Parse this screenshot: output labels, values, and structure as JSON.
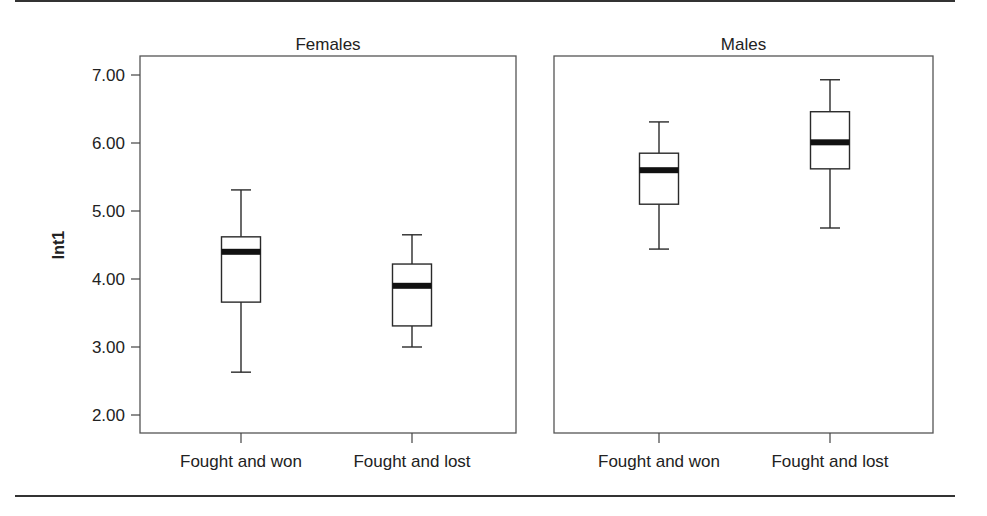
{
  "figure": {
    "y_axis_label": "Int1",
    "panels": [
      "Females",
      "Males"
    ]
  },
  "chart_data": {
    "type": "boxplot",
    "title": "",
    "ylabel": "Int1",
    "xlabel": "",
    "ylim": [
      1.7,
      7.27
    ],
    "yticks": [
      2.0,
      3.0,
      4.0,
      5.0,
      6.0,
      7.0
    ],
    "ytick_labels": [
      "2.00",
      "3.00",
      "4.00",
      "5.00",
      "6.00",
      "7.00"
    ],
    "grid": false,
    "legend": null,
    "panels": [
      {
        "title": "Females",
        "categories": [
          "Fought and won",
          "Fought and lost"
        ],
        "boxes": [
          {
            "label": "Fought and won",
            "whisker_low": 2.63,
            "q1": 3.66,
            "median": 4.4,
            "q3": 4.62,
            "whisker_high": 5.31
          },
          {
            "label": "Fought and lost",
            "whisker_low": 3.0,
            "q1": 3.31,
            "median": 3.9,
            "q3": 4.22,
            "whisker_high": 4.65
          }
        ]
      },
      {
        "title": "Males",
        "categories": [
          "Fought and won",
          "Fought and lost"
        ],
        "boxes": [
          {
            "label": "Fought and won",
            "whisker_low": 4.44,
            "q1": 5.1,
            "median": 5.6,
            "q3": 5.85,
            "whisker_high": 6.31
          },
          {
            "label": "Fought and lost",
            "whisker_low": 4.75,
            "q1": 5.62,
            "median": 6.01,
            "q3": 6.46,
            "whisker_high": 6.93
          }
        ]
      }
    ]
  }
}
